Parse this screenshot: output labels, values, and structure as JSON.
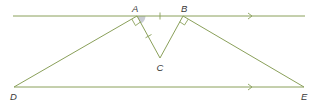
{
  "diagram": {
    "title": "",
    "colors": {
      "line": "#8aa05a",
      "label": "#3a3a3a",
      "angle_shading": "#c9ccd4",
      "background": "#ffffff"
    },
    "points": {
      "A": {
        "label": "A",
        "x": 137,
        "y": 16
      },
      "B": {
        "label": "B",
        "x": 183,
        "y": 16
      },
      "C": {
        "label": "C",
        "x": 160,
        "y": 58
      },
      "D": {
        "label": "D",
        "x": 14,
        "y": 87
      },
      "E": {
        "label": "E",
        "x": 304,
        "y": 87
      }
    },
    "labels": {
      "A": "A",
      "B": "B",
      "C": "C",
      "D": "D",
      "E": "E"
    },
    "segments": [
      {
        "name": "top-parallel-line",
        "from": "line-start",
        "to": "line-end",
        "arrow": true
      },
      {
        "name": "bottom-parallel-line DE",
        "from": "D",
        "to": "E",
        "arrow": true
      },
      {
        "name": "DA",
        "from": "D",
        "to": "A"
      },
      {
        "name": "AC",
        "from": "A",
        "to": "C",
        "tick": 1
      },
      {
        "name": "CB",
        "from": "C",
        "to": "B"
      },
      {
        "name": "BE",
        "from": "B",
        "to": "E"
      }
    ],
    "annotations": {
      "parallel_arrows": "top line and DE are parallel (single arrow each)",
      "equal_ticks": "AB and AC each have one tick mark (equal length)",
      "right_angles": [
        "angle DAC = 90°",
        "angle CBE = 90°"
      ],
      "shaded_angle": "angle at A between AC and AB"
    }
  }
}
